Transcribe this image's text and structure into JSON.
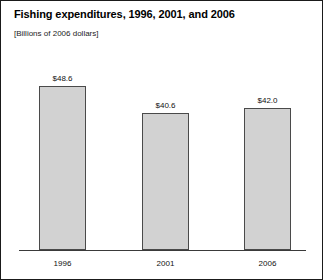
{
  "chart_data": {
    "type": "bar",
    "title": "Fishing expenditures, 1996, 2001, and 2006",
    "subtitle": "[Billions of 2006 dollars]",
    "xlabel": "",
    "ylabel": "",
    "categories": [
      "1996",
      "2001",
      "2006"
    ],
    "values": [
      48.6,
      40.6,
      42.0
    ],
    "value_labels": [
      "$48.6",
      "$40.6",
      "$42.0"
    ],
    "ylim": [
      0,
      50
    ],
    "grid": false,
    "legend": null,
    "colors": {
      "bar_fill": "#d2d2d2",
      "bar_border": "#4a4a4a",
      "axis": "#3a3a3a",
      "text": "#111111",
      "frame": "#1a1a1a",
      "background": "#ffffff"
    }
  }
}
